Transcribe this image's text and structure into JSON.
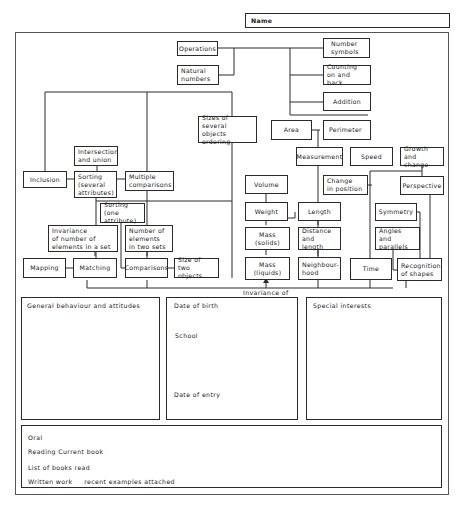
{
  "header": {
    "name_label": "Name"
  },
  "diagram": {
    "nodes": {
      "operations": "Operations",
      "natural_numbers": "Natural\nnumbers",
      "number_symbols": "Number\nsymbols",
      "counting": "Counting\non and back",
      "addition": "Addition",
      "sizes_several": "Sizes of\nseveral objects\nordering",
      "area": "Area",
      "perimeter": "Perimeter",
      "measurement": "Measurement",
      "speed": "Speed",
      "growth": "Growth\nand change",
      "change_position": "Change\nin position",
      "perspective": "Perspective",
      "intersection": "Intersection\nand union",
      "inclusion": "Inclusion",
      "sorting_several": "Sorting\n(several\nattributes)",
      "multiple_comparisons": "Multiple\ncomparisons",
      "sorting_one": "Sorting (one\nattribute)",
      "invariance_number": "Invariance\nof number of\nelements in a set",
      "number_elements": "Number of\nelements\nin two sets",
      "mapping": "Mapping",
      "matching": "Matching",
      "comparisons": "Comparisons",
      "size_two": "Size of two\nobjects",
      "volume": "Volume",
      "weight": "Weight",
      "length": "Length",
      "mass_solids": "Mass (solids)",
      "distance_length": "Distance\nand length",
      "mass_liquids": "Mass (liquids)",
      "neighbourhood": "Neighbour-\nhood",
      "time": "Time",
      "symmetry": "Symmetry",
      "angles": "Angles\nand parallels",
      "recognition": "Recognition\nof shapes"
    },
    "invariance_label": "Invariance of"
  },
  "panels": {
    "general": {
      "title": "General behaviour and attitudes"
    },
    "personal": {
      "date_of_birth": "Date of birth",
      "school": "School",
      "date_of_entry": "Date of entry"
    },
    "special": {
      "title": "Special interests"
    }
  },
  "language": {
    "oral": "Oral",
    "reading": "Reading  Current book",
    "books_read": "List of books read",
    "written": "Written work     recent examples attached"
  }
}
